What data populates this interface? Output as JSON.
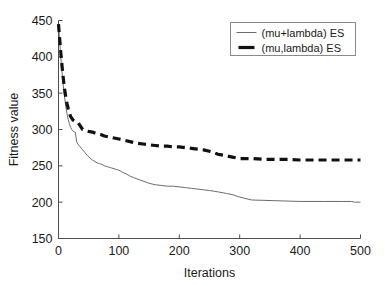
{
  "chart_data": {
    "type": "line",
    "title": "",
    "xlabel": "Iterations",
    "ylabel": "Fitness value",
    "xlim": [
      0,
      500
    ],
    "ylim": [
      150,
      450
    ],
    "xticks": [
      0,
      100,
      200,
      300,
      400,
      500
    ],
    "yticks": [
      150,
      200,
      250,
      300,
      350,
      400,
      450
    ],
    "grid": false,
    "legend_position": "top-right",
    "background": "#ffffff",
    "series": [
      {
        "name": "(mu+lambda) ES",
        "style": "solid",
        "color": "#6b6b6b",
        "width": 1,
        "x": [
          0,
          2,
          4,
          6,
          8,
          10,
          12,
          14,
          16,
          18,
          20,
          22,
          25,
          28,
          30,
          32,
          34,
          36,
          38,
          40,
          44,
          48,
          52,
          56,
          60,
          64,
          68,
          72,
          76,
          80,
          84,
          88,
          92,
          96,
          100,
          106,
          112,
          118,
          124,
          130,
          140,
          150,
          160,
          170,
          180,
          190,
          200,
          210,
          220,
          230,
          240,
          250,
          258,
          265,
          272,
          278,
          284,
          290,
          296,
          300,
          320,
          360,
          400,
          440,
          470,
          485,
          490,
          500
        ],
        "y": [
          445,
          420,
          398,
          378,
          360,
          345,
          332,
          322,
          314,
          308,
          303,
          300,
          297,
          296,
          283,
          280,
          278,
          276,
          274,
          272,
          268,
          264,
          261,
          258,
          256,
          254,
          253,
          252,
          250,
          249,
          248,
          247,
          246,
          245,
          244,
          241,
          239,
          236,
          234,
          232,
          229,
          226,
          224,
          223,
          222,
          222,
          221,
          220,
          219,
          218,
          217,
          216,
          215,
          214,
          213,
          212,
          211,
          210,
          208,
          207,
          203,
          202,
          201,
          201,
          201,
          201,
          200,
          200
        ]
      },
      {
        "name": "(mu,lambda) ES",
        "style": "dashed",
        "color": "#111111",
        "width": 3.2,
        "x": [
          0,
          2,
          4,
          6,
          8,
          10,
          12,
          14,
          16,
          18,
          20,
          24,
          28,
          32,
          36,
          40,
          46,
          52,
          58,
          64,
          70,
          76,
          82,
          88,
          94,
          100,
          110,
          120,
          130,
          140,
          150,
          160,
          170,
          180,
          190,
          200,
          210,
          220,
          230,
          240,
          250,
          258,
          264,
          270,
          276,
          282,
          288,
          294,
          300,
          320,
          340,
          360,
          380,
          400,
          420,
          440,
          460,
          480,
          500
        ],
        "y": [
          445,
          424,
          404,
          386,
          370,
          356,
          345,
          336,
          329,
          323,
          318,
          313,
          311,
          310,
          305,
          300,
          298,
          297,
          296,
          294,
          293,
          291,
          290,
          289,
          288,
          287,
          285,
          283,
          281,
          280,
          279,
          278,
          277,
          277,
          276,
          276,
          275,
          274,
          273,
          272,
          270,
          268,
          266,
          265,
          264,
          263,
          262,
          261,
          260,
          260,
          259,
          259,
          259,
          258,
          258,
          258,
          258,
          258,
          258
        ]
      }
    ]
  },
  "axes": {
    "x_tick_labels": [
      "0",
      "100",
      "200",
      "300",
      "400",
      "500"
    ],
    "y_tick_labels": [
      "150",
      "200",
      "250",
      "300",
      "350",
      "400",
      "450"
    ],
    "x_axis_title": "Iterations",
    "y_axis_title": "Fitness value"
  },
  "legend": {
    "entries": [
      {
        "label": "(mu+lambda) ES",
        "style": "solid"
      },
      {
        "label": "(mu,lambda) ES",
        "style": "dashed"
      }
    ]
  }
}
